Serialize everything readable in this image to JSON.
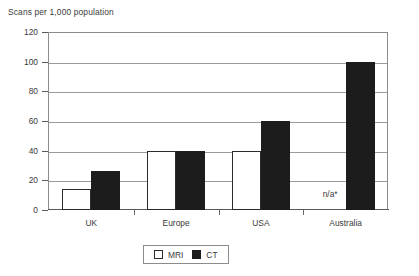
{
  "chart_data": {
    "type": "bar",
    "title": "Scans per 1,000 population",
    "xlabel": "",
    "ylabel": "",
    "ylim": [
      0,
      120
    ],
    "yticks": [
      0,
      20,
      40,
      60,
      80,
      100,
      120
    ],
    "grid": true,
    "legend_position": "bottom",
    "categories": [
      "UK",
      "Europe",
      "USA",
      "Australia"
    ],
    "series": [
      {
        "name": "MRI",
        "values": [
          14,
          40,
          40,
          null
        ],
        "color": "#ffffff"
      },
      {
        "name": "CT",
        "values": [
          26,
          40,
          60,
          100
        ],
        "color": "#1c1c1c"
      }
    ],
    "annotations": [
      {
        "text": "n/a*",
        "category": "Australia",
        "series": "MRI"
      }
    ]
  },
  "legend": {
    "items": [
      {
        "label": "MRI",
        "swatch": "white-square-icon"
      },
      {
        "label": "CT",
        "swatch": "black-square-icon"
      }
    ]
  }
}
